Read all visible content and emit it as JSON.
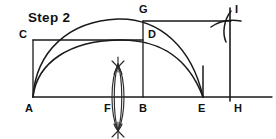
{
  "figure": {
    "title": "Step 2",
    "type": "geometric-construction-diagram",
    "stroke_color": "#1a1a1a",
    "background_color": "#ffffff",
    "labels": {
      "A": "A",
      "B": "B",
      "C": "C",
      "D": "D",
      "E": "E",
      "F": "F",
      "G": "G",
      "H": "H",
      "I": "I"
    },
    "points": [
      {
        "name": "A",
        "label": "A",
        "x": 33,
        "y": 97,
        "label_x": 25,
        "label_y": 112
      },
      {
        "name": "F",
        "label": "F",
        "x": 118,
        "y": 97,
        "label_x": 104,
        "label_y": 112
      },
      {
        "name": "B",
        "label": "B",
        "x": 143,
        "y": 97,
        "label_x": 139,
        "label_y": 112
      },
      {
        "name": "E",
        "label": "E",
        "x": 203,
        "y": 97,
        "label_x": 198,
        "label_y": 112
      },
      {
        "name": "H",
        "label": "H",
        "x": 230,
        "y": 97,
        "label_x": 233,
        "label_y": 112
      },
      {
        "name": "C",
        "label": "C",
        "x": 33,
        "y": 40,
        "label_x": 21,
        "label_y": 38
      },
      {
        "name": "D",
        "label": "D",
        "x": 143,
        "y": 40,
        "label_x": 147,
        "label_y": 38
      },
      {
        "name": "G",
        "label": "G",
        "x": 143,
        "y": 21,
        "label_x": 139,
        "label_y": 13
      },
      {
        "name": "I",
        "label": "I",
        "x": 230,
        "y": 21,
        "label_x": 234,
        "label_y": 13
      }
    ],
    "segments": [
      {
        "name": "baseline-A-to-right-edge",
        "from": "A",
        "to": "right-edge"
      },
      {
        "name": "vertical-A-to-C",
        "from": "A",
        "to": "C"
      },
      {
        "name": "horizontal-C-to-D",
        "from": "C",
        "to": "D"
      },
      {
        "name": "vertical-B-to-G",
        "from": "B",
        "to": "G"
      },
      {
        "name": "horizontal-G-to-I",
        "from": "G",
        "to": "I"
      },
      {
        "name": "vertical-H-to-I",
        "from": "H",
        "to": "I"
      }
    ],
    "arcs": [
      {
        "name": "large-semicircle-A-to-E",
        "from": "A",
        "to": "E",
        "apex_height": 19
      },
      {
        "name": "small-arc-C-through-D-to-E",
        "from": "C",
        "to": "E",
        "through": "D"
      }
    ],
    "construction_marks": [
      {
        "name": "vesica-lens-at-F",
        "center_x": 118,
        "top_y": 64,
        "bottom_y": 131
      },
      {
        "name": "arc-cross-at-I",
        "x": 230,
        "y": 21
      }
    ]
  }
}
